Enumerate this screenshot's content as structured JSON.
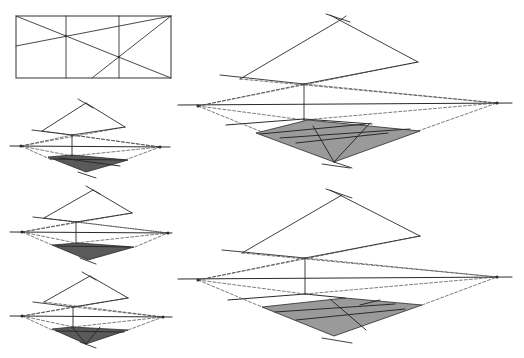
{
  "colors": {
    "background": "#ffffff",
    "line": "#2a2a2a",
    "thin_line": "#555555",
    "dashed": "#444444",
    "fill_small": "#5a5a5a",
    "fill_large": "#9a9a9a",
    "frame": "#333333"
  },
  "frame_diagram": {
    "rect": [
      16,
      16,
      155,
      62
    ],
    "verticals": [
      66,
      119
    ],
    "lines": [
      [
        16,
        16,
        171,
        78
      ],
      [
        16,
        46,
        171,
        16
      ],
      [
        92,
        78,
        171,
        16
      ]
    ],
    "dots": [
      [
        66,
        36
      ],
      [
        119,
        57
      ]
    ]
  },
  "perspective_diagrams": [
    {
      "id": "small-1",
      "shade": "fill_small",
      "horizon": [
        10,
        146,
        170,
        147
      ],
      "vp_left": [
        21,
        146
      ],
      "vp_right": [
        160,
        147
      ],
      "top_pt": [
        86,
        103
      ],
      "top_cross": [
        [
          78,
          99,
          93,
          108
        ]
      ],
      "left_top": [
        42,
        131
      ],
      "right_top": [
        125,
        127
      ],
      "mid_top": [
        72,
        135
      ],
      "mid_bottom": [
        72,
        156
      ],
      "lines": [
        [
          32,
          130,
          72,
          135
        ],
        [
          72,
          135,
          125,
          127
        ],
        [
          42,
          131,
          86,
          103
        ],
        [
          86,
          103,
          125,
          127
        ],
        [
          72,
          135,
          72,
          156
        ]
      ],
      "dashed": [
        [
          21,
          146,
          72,
          135
        ],
        [
          72,
          135,
          160,
          147
        ],
        [
          21,
          146,
          125,
          127
        ],
        [
          42,
          131,
          160,
          147
        ],
        [
          21,
          146,
          72,
          156
        ],
        [
          72,
          156,
          160,
          147
        ],
        [
          21,
          146,
          52,
          160
        ],
        [
          125,
          160,
          160,
          147
        ]
      ],
      "shaded": [
        [
          48,
          157
        ],
        [
          72,
          155
        ],
        [
          128,
          160
        ],
        [
          86,
          172
        ]
      ],
      "shade_lines": [
        [
          50,
          159,
          125,
          160
        ],
        [
          60,
          158,
          120,
          166
        ]
      ],
      "bottom_cross": [
        [
          78,
          172,
          96,
          178
        ]
      ]
    },
    {
      "id": "small-2",
      "shade": "fill_small",
      "horizon": [
        10,
        232,
        172,
        233
      ],
      "vp_left": [
        22,
        232
      ],
      "vp_right": [
        168,
        233
      ],
      "top_pt": [
        93,
        190
      ],
      "top_cross": [
        [
          86,
          186,
          100,
          194
        ]
      ],
      "left_top": [
        44,
        218
      ],
      "right_top": [
        132,
        213
      ],
      "mid_top": [
        76,
        222
      ],
      "mid_bottom": [
        76,
        243
      ],
      "lines": [
        [
          33,
          217,
          76,
          222
        ],
        [
          76,
          222,
          132,
          213
        ],
        [
          44,
          218,
          93,
          190
        ],
        [
          93,
          190,
          132,
          213
        ],
        [
          76,
          222,
          76,
          243
        ]
      ],
      "dashed": [
        [
          22,
          232,
          76,
          222
        ],
        [
          76,
          222,
          168,
          233
        ],
        [
          22,
          232,
          132,
          213
        ],
        [
          44,
          218,
          168,
          233
        ],
        [
          22,
          232,
          76,
          243
        ],
        [
          76,
          243,
          168,
          233
        ],
        [
          22,
          232,
          52,
          245
        ],
        [
          135,
          247,
          168,
          233
        ]
      ],
      "shaded": [
        [
          52,
          245
        ],
        [
          78,
          243
        ],
        [
          134,
          247
        ],
        [
          88,
          260
        ]
      ],
      "shade_lines": [
        [
          56,
          246,
          130,
          247
        ]
      ],
      "bottom_cross": [
        [
          80,
          258,
          96,
          264
        ]
      ]
    },
    {
      "id": "small-3",
      "shade": "fill_small",
      "horizon": [
        10,
        316,
        172,
        317
      ],
      "vp_left": [
        22,
        316
      ],
      "vp_right": [
        163,
        317
      ],
      "top_pt": [
        90,
        276
      ],
      "top_cross": [
        [
          82,
          272,
          96,
          280
        ]
      ],
      "left_top": [
        44,
        302
      ],
      "right_top": [
        128,
        298
      ],
      "mid_top": [
        73,
        307
      ],
      "mid_bottom": [
        73,
        327
      ],
      "lines": [
        [
          33,
          302,
          73,
          307
        ],
        [
          73,
          307,
          128,
          298
        ],
        [
          44,
          302,
          90,
          276
        ],
        [
          90,
          276,
          128,
          298
        ],
        [
          73,
          307,
          73,
          327
        ]
      ],
      "dashed": [
        [
          22,
          316,
          73,
          307
        ],
        [
          73,
          307,
          163,
          317
        ],
        [
          22,
          316,
          128,
          298
        ],
        [
          44,
          302,
          163,
          317
        ],
        [
          22,
          316,
          73,
          327
        ],
        [
          73,
          327,
          163,
          317
        ],
        [
          22,
          316,
          52,
          330
        ],
        [
          128,
          330,
          163,
          317
        ]
      ],
      "shaded": [
        [
          52,
          329
        ],
        [
          72,
          327
        ],
        [
          128,
          330
        ],
        [
          86,
          344
        ]
      ],
      "shade_lines": [
        [
          72,
          327,
          86,
          344
        ],
        [
          100,
          327,
          86,
          344
        ],
        [
          56,
          331,
          124,
          332
        ]
      ],
      "bottom_cross": [
        [
          80,
          342,
          96,
          348
        ]
      ]
    },
    {
      "id": "large-top",
      "shade": "fill_large",
      "horizon": [
        178,
        105,
        512,
        103
      ],
      "vp_left": [
        198,
        106
      ],
      "vp_right": [
        497,
        103
      ],
      "top_pt": [
        342,
        19
      ],
      "top_cross": [
        [
          326,
          14,
          350,
          22
        ],
        [
          342,
          19,
          346,
          16
        ]
      ],
      "left_top": [
        240,
        79
      ],
      "right_top": [
        418,
        62
      ],
      "mid_top": [
        304,
        84
      ],
      "mid_bottom": [
        304,
        120
      ],
      "lines": [
        [
          220,
          75,
          304,
          84
        ],
        [
          304,
          84,
          418,
          62
        ],
        [
          240,
          79,
          342,
          19
        ],
        [
          330,
          15,
          418,
          62
        ],
        [
          304,
          84,
          304,
          120
        ]
      ],
      "dashed": [
        [
          198,
          106,
          304,
          84
        ],
        [
          304,
          84,
          497,
          103
        ],
        [
          198,
          106,
          418,
          62
        ],
        [
          240,
          79,
          497,
          103
        ],
        [
          198,
          106,
          304,
          120
        ],
        [
          304,
          120,
          497,
          103
        ],
        [
          198,
          106,
          262,
          132
        ],
        [
          418,
          131,
          497,
          103
        ]
      ],
      "shaded": [
        [
          256,
          133
        ],
        [
          308,
          120
        ],
        [
          420,
          131
        ],
        [
          334,
          162
        ]
      ],
      "shade_lines": [
        [
          226,
          125,
          304,
          119
        ],
        [
          304,
          119,
          372,
          124
        ],
        [
          260,
          134,
          366,
          124
        ],
        [
          280,
          138,
          410,
          129
        ],
        [
          296,
          143,
          388,
          133
        ],
        [
          313,
          126,
          334,
          162
        ],
        [
          370,
          123,
          334,
          162
        ]
      ],
      "bottom_cross": [
        [
          322,
          164,
          350,
          168
        ],
        [
          334,
          162,
          352,
          168
        ]
      ]
    },
    {
      "id": "large-bottom",
      "shade": "fill_large",
      "horizon": [
        178,
        279,
        512,
        277
      ],
      "vp_left": [
        198,
        280
      ],
      "vp_right": [
        497,
        277
      ],
      "top_pt": [
        342,
        195
      ],
      "top_cross": [
        [
          326,
          189,
          352,
          198
        ]
      ],
      "left_top": [
        242,
        253
      ],
      "right_top": [
        420,
        236
      ],
      "mid_top": [
        305,
        258
      ],
      "mid_bottom": [
        305,
        294
      ],
      "lines": [
        [
          222,
          250,
          305,
          258
        ],
        [
          305,
          258,
          420,
          236
        ],
        [
          242,
          253,
          342,
          195
        ],
        [
          330,
          190,
          420,
          236
        ],
        [
          305,
          258,
          305,
          294
        ]
      ],
      "dashed": [
        [
          198,
          280,
          305,
          258
        ],
        [
          305,
          258,
          497,
          277
        ],
        [
          198,
          280,
          420,
          236
        ],
        [
          242,
          253,
          497,
          277
        ],
        [
          198,
          280,
          305,
          294
        ],
        [
          305,
          294,
          497,
          277
        ],
        [
          198,
          280,
          262,
          307
        ],
        [
          422,
          305,
          497,
          277
        ]
      ],
      "shaded": [
        [
          262,
          307
        ],
        [
          345,
          298
        ],
        [
          422,
          305
        ],
        [
          334,
          336
        ]
      ],
      "shade_lines": [
        [
          228,
          300,
          305,
          294
        ],
        [
          305,
          294,
          345,
          298
        ],
        [
          275,
          312,
          395,
          304
        ],
        [
          296,
          320,
          405,
          309
        ],
        [
          330,
          299,
          366,
          330
        ],
        [
          380,
          300,
          360,
          305
        ]
      ],
      "bottom_cross": [
        [
          322,
          338,
          352,
          343
        ]
      ]
    }
  ]
}
